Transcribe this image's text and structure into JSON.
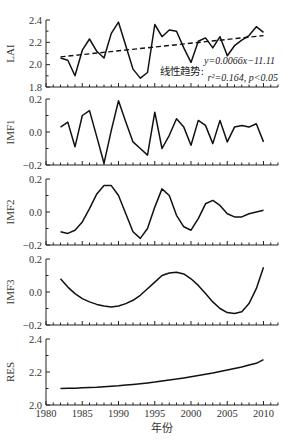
{
  "chart_data": {
    "type": "line",
    "x": [
      1982,
      1983,
      1984,
      1985,
      1986,
      1987,
      1988,
      1989,
      1990,
      1991,
      1992,
      1993,
      1994,
      1995,
      1996,
      1997,
      1998,
      1999,
      2000,
      2001,
      2002,
      2003,
      2004,
      2005,
      2006,
      2007,
      2008,
      2009,
      2010
    ],
    "xlabel": "年份",
    "xlim": [
      1980,
      2012
    ],
    "xticks": [
      1980,
      1985,
      1990,
      1995,
      2000,
      2005,
      2010
    ],
    "panels": [
      {
        "ylabel": "LAI",
        "ylim": [
          1.8,
          2.4
        ],
        "yticks": [
          1.8,
          2.0,
          2.2,
          2.4
        ],
        "ytick_labels": [
          "1.8",
          "2.0",
          "2.2",
          "2.4"
        ],
        "series": [
          {
            "name": "LAI",
            "style": "solid",
            "values": [
              2.06,
              2.04,
              1.9,
              2.13,
              2.23,
              2.12,
              2.06,
              2.28,
              2.38,
              2.17,
              1.96,
              1.88,
              1.93,
              2.36,
              2.25,
              2.31,
              2.3,
              2.15,
              2.02,
              2.21,
              2.24,
              2.15,
              2.25,
              2.08,
              2.17,
              2.22,
              2.26,
              2.34,
              2.29
            ]
          },
          {
            "name": "线性趋势",
            "style": "dashed",
            "slope": 0.0066,
            "intercept": -11.11,
            "values_at_ends": {
              "1982": 2.07,
              "2010": 2.26
            }
          }
        ],
        "annotations": {
          "trend_label": "线性趋势:",
          "equation": "y=0.0066x−11.11",
          "stats": "r²=0.164, p<0.05"
        }
      },
      {
        "ylabel": "IMF1",
        "ylim": [
          -0.2,
          0.2
        ],
        "yticks": [
          -0.2,
          0.0,
          0.2
        ],
        "ytick_labels": [
          "−0.2",
          "0.0",
          "0.2"
        ],
        "series": [
          {
            "name": "IMF1",
            "style": "solid",
            "values": [
              0.03,
              0.06,
              -0.09,
              0.1,
              0.13,
              -0.03,
              -0.19,
              0.01,
              0.19,
              0.06,
              -0.06,
              -0.1,
              -0.14,
              0.12,
              -0.1,
              -0.02,
              0.08,
              0.03,
              -0.08,
              0.07,
              0.04,
              -0.07,
              0.07,
              -0.06,
              0.03,
              0.04,
              0.03,
              0.05,
              -0.06
            ]
          }
        ]
      },
      {
        "ylabel": "IMF2",
        "ylim": [
          -0.2,
          0.2
        ],
        "yticks": [
          -0.2,
          0.0,
          0.2
        ],
        "ytick_labels": [
          "−0.2",
          "0.0",
          "0.2"
        ],
        "series": [
          {
            "name": "IMF2",
            "style": "solid",
            "values": [
              -0.12,
              -0.13,
              -0.11,
              -0.06,
              0.02,
              0.11,
              0.16,
              0.16,
              0.1,
              -0.01,
              -0.12,
              -0.16,
              -0.1,
              0.03,
              0.14,
              0.1,
              -0.02,
              -0.09,
              -0.11,
              -0.04,
              0.05,
              0.07,
              0.04,
              -0.01,
              -0.03,
              -0.03,
              -0.01,
              0.0,
              0.01
            ]
          }
        ]
      },
      {
        "ylabel": "IMF3",
        "ylim": [
          -0.2,
          0.2
        ],
        "yticks": [
          -0.2,
          0.0,
          0.2
        ],
        "ytick_labels": [
          "−0.2",
          "0.0",
          "0.2"
        ],
        "series": [
          {
            "name": "IMF3",
            "style": "solid",
            "values": [
              0.08,
              0.03,
              -0.01,
              -0.04,
              -0.06,
              -0.075,
              -0.085,
              -0.09,
              -0.085,
              -0.07,
              -0.05,
              -0.02,
              0.02,
              0.06,
              0.1,
              0.115,
              0.12,
              0.11,
              0.08,
              0.04,
              -0.01,
              -0.06,
              -0.1,
              -0.125,
              -0.13,
              -0.12,
              -0.07,
              0.02,
              0.15
            ]
          }
        ]
      },
      {
        "ylabel": "RES",
        "ylim": [
          2.0,
          2.4
        ],
        "yticks": [
          2.0,
          2.2,
          2.4
        ],
        "ytick_labels": [
          "2.0",
          "2.2",
          "2.4"
        ],
        "series": [
          {
            "name": "RES",
            "style": "solid",
            "values": [
              2.1,
              2.101,
              2.102,
              2.104,
              2.106,
              2.108,
              2.111,
              2.114,
              2.117,
              2.121,
              2.125,
              2.129,
              2.134,
              2.139,
              2.145,
              2.151,
              2.157,
              2.164,
              2.171,
              2.178,
              2.186,
              2.194,
              2.203,
              2.212,
              2.221,
              2.231,
              2.242,
              2.253,
              2.275
            ]
          }
        ]
      }
    ],
    "grid": false,
    "legend": null
  }
}
